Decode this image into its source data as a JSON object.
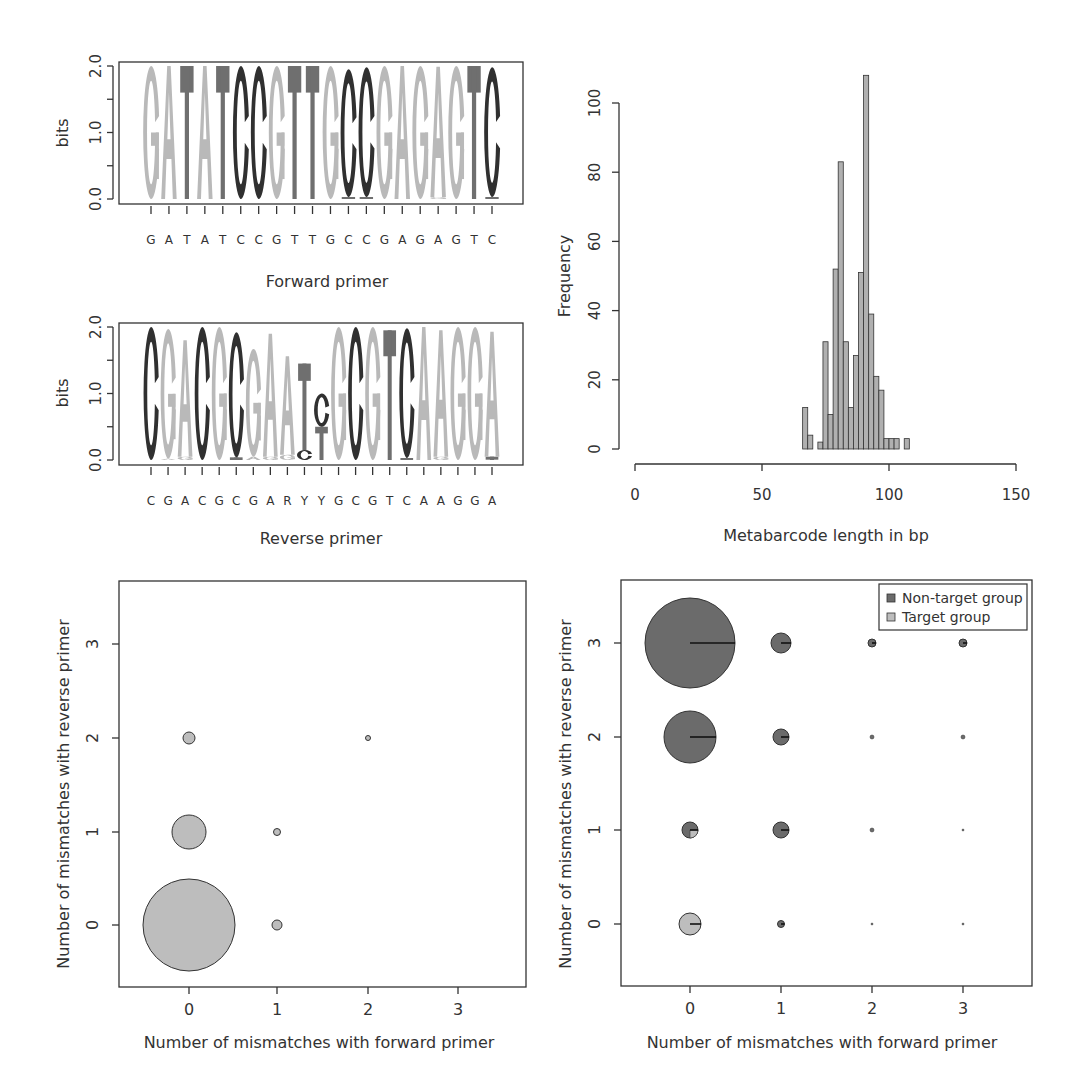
{
  "colors": {
    "A": "#b9b9b9",
    "G": "#b9b9b9",
    "T": "#6f6f6f",
    "C": "#303030",
    "hist_fill": "#b0b0b0",
    "non_target": "#6b6b6b",
    "target": "#bdbdbd",
    "axis": "#333333"
  },
  "chart_data": [
    {
      "id": "forward-logo",
      "type": "sequence_logo",
      "title": "",
      "xlabel": "Forward primer",
      "ylabel": "bits",
      "ylim": [
        0,
        2
      ],
      "yticks": [
        "0.0",
        "1.0",
        "2.0"
      ],
      "sequence": [
        "G",
        "A",
        "T",
        "A",
        "T",
        "C",
        "C",
        "G",
        "T",
        "T",
        "G",
        "C",
        "C",
        "G",
        "A",
        "G",
        "A",
        "G",
        "T",
        "C"
      ],
      "stacks": [
        [
          {
            "l": "G",
            "h": 2.0
          }
        ],
        [
          {
            "l": "A",
            "h": 2.0
          }
        ],
        [
          {
            "l": "T",
            "h": 2.0
          }
        ],
        [
          {
            "l": "A",
            "h": 2.0
          }
        ],
        [
          {
            "l": "T",
            "h": 2.0
          }
        ],
        [
          {
            "l": "C",
            "h": 2.0
          }
        ],
        [
          {
            "l": "C",
            "h": 2.0
          }
        ],
        [
          {
            "l": "G",
            "h": 2.0
          }
        ],
        [
          {
            "l": "T",
            "h": 2.0
          }
        ],
        [
          {
            "l": "T",
            "h": 2.0
          }
        ],
        [
          {
            "l": "G",
            "h": 2.0
          }
        ],
        [
          {
            "l": "T",
            "h": 0.03
          },
          {
            "l": "C",
            "h": 1.92
          }
        ],
        [
          {
            "l": "T",
            "h": 0.03
          },
          {
            "l": "C",
            "h": 1.95
          }
        ],
        [
          {
            "l": "G",
            "h": 2.0
          }
        ],
        [
          {
            "l": "A",
            "h": 2.0
          }
        ],
        [
          {
            "l": "G",
            "h": 2.0
          }
        ],
        [
          {
            "l": "G",
            "h": 0.03
          },
          {
            "l": "A",
            "h": 1.96
          }
        ],
        [
          {
            "l": "G",
            "h": 2.0
          }
        ],
        [
          {
            "l": "T",
            "h": 2.0
          }
        ],
        [
          {
            "l": "T",
            "h": 0.03
          },
          {
            "l": "C",
            "h": 1.95
          }
        ]
      ]
    },
    {
      "id": "reverse-logo",
      "type": "sequence_logo",
      "title": "",
      "xlabel": "Reverse primer",
      "ylabel": "bits",
      "ylim": [
        0,
        2
      ],
      "yticks": [
        "0.0",
        "1.0",
        "2.0"
      ],
      "sequence": [
        "C",
        "G",
        "A",
        "C",
        "G",
        "C",
        "G",
        "A",
        "R",
        "Y",
        "Y",
        "G",
        "C",
        "G",
        "T",
        "C",
        "A",
        "A",
        "G",
        "G",
        "A"
      ],
      "stacks": [
        [
          {
            "l": "C",
            "h": 2.0
          }
        ],
        [
          {
            "l": "A",
            "h": 0.02
          },
          {
            "l": "G",
            "h": 1.95
          }
        ],
        [
          {
            "l": "G",
            "h": 0.05
          },
          {
            "l": "A",
            "h": 1.75
          }
        ],
        [
          {
            "l": "C",
            "h": 2.0
          }
        ],
        [
          {
            "l": "G",
            "h": 2.0
          }
        ],
        [
          {
            "l": "T",
            "h": 0.04
          },
          {
            "l": "C",
            "h": 1.88
          }
        ],
        [
          {
            "l": "A",
            "h": 0.05
          },
          {
            "l": "G",
            "h": 1.62
          }
        ],
        [
          {
            "l": "G",
            "h": 0.05
          },
          {
            "l": "A",
            "h": 1.85
          }
        ],
        [
          {
            "l": "G",
            "h": 0.08
          },
          {
            "l": "A",
            "h": 1.48
          }
        ],
        [
          {
            "l": "C",
            "h": 0.15
          },
          {
            "l": "T",
            "h": 1.3
          }
        ],
        [
          {
            "l": "T",
            "h": 0.5
          },
          {
            "l": "C",
            "h": 0.5
          }
        ],
        [
          {
            "l": "G",
            "h": 2.0
          }
        ],
        [
          {
            "l": "C",
            "h": 2.0
          }
        ],
        [
          {
            "l": "G",
            "h": 2.0
          }
        ],
        [
          {
            "l": "T",
            "h": 1.95
          }
        ],
        [
          {
            "l": "T",
            "h": 0.03
          },
          {
            "l": "C",
            "h": 1.95
          }
        ],
        [
          {
            "l": "A",
            "h": 2.0
          }
        ],
        [
          {
            "l": "G",
            "h": 0.05
          },
          {
            "l": "A",
            "h": 1.9
          }
        ],
        [
          {
            "l": "G",
            "h": 2.0
          }
        ],
        [
          {
            "l": "G",
            "h": 2.0
          }
        ],
        [
          {
            "l": "T",
            "h": 0.05
          },
          {
            "l": "A",
            "h": 1.88
          }
        ]
      ]
    },
    {
      "id": "length-histogram",
      "type": "bar",
      "title": "",
      "xlabel": "Metabarcode length in bp",
      "ylabel": "Frequency",
      "xlim": [
        0,
        150
      ],
      "ylim": [
        0,
        100
      ],
      "xticks": [
        0,
        50,
        100,
        150
      ],
      "yticks": [
        0,
        20,
        40,
        60,
        80,
        100
      ],
      "bin_width": 2,
      "bin_start": 66,
      "values": [
        12,
        4,
        0,
        2,
        31,
        10,
        52,
        83,
        31,
        12,
        27,
        51,
        108,
        39,
        21,
        17,
        3,
        3,
        3,
        0,
        3
      ]
    },
    {
      "id": "target-bubble",
      "type": "scatter",
      "title": "",
      "xlabel": "Number of mismatches with forward primer",
      "ylabel": "Number of mismatches with reverse primer",
      "xlim": [
        -0.8,
        3.7
      ],
      "ylim": [
        -0.65,
        3.7
      ],
      "xticks": [
        0,
        1,
        2,
        3
      ],
      "yticks": [
        0,
        1,
        2,
        3
      ],
      "points": [
        {
          "x": 0,
          "y": 0,
          "r": 46,
          "target": 1.0
        },
        {
          "x": 0,
          "y": 1,
          "r": 17,
          "target": 1.0
        },
        {
          "x": 0,
          "y": 2,
          "r": 6,
          "target": 1.0
        },
        {
          "x": 1,
          "y": 0,
          "r": 5,
          "target": 1.0
        },
        {
          "x": 1,
          "y": 1,
          "r": 3.5,
          "target": 1.0
        },
        {
          "x": 2,
          "y": 2,
          "r": 2.5,
          "target": 1.0
        }
      ]
    },
    {
      "id": "group-pie-bubble",
      "type": "scatter",
      "title": "",
      "xlabel": "Number of mismatches with forward primer",
      "ylabel": "Number of mismatches with reverse primer",
      "xlim": [
        -0.75,
        3.75
      ],
      "ylim": [
        -0.65,
        3.7
      ],
      "xticks": [
        0,
        1,
        2,
        3
      ],
      "yticks": [
        0,
        1,
        2,
        3
      ],
      "legend": [
        {
          "label": "Non-target group",
          "key": "non_target"
        },
        {
          "label": "Target group",
          "key": "target"
        }
      ],
      "points": [
        {
          "x": 0,
          "y": 3,
          "r": 45,
          "target": 0.0
        },
        {
          "x": 1,
          "y": 3,
          "r": 10,
          "target": 0.0
        },
        {
          "x": 2,
          "y": 3,
          "r": 4,
          "target": 0.0
        },
        {
          "x": 3,
          "y": 3,
          "r": 4,
          "target": 0.0
        },
        {
          "x": 0,
          "y": 2,
          "r": 26,
          "target": 0.0
        },
        {
          "x": 1,
          "y": 2,
          "r": 8,
          "target": 0.0
        },
        {
          "x": 2,
          "y": 2,
          "r": 2,
          "target": 0.0
        },
        {
          "x": 3,
          "y": 2,
          "r": 2,
          "target": 0.0
        },
        {
          "x": 0,
          "y": 1,
          "r": 8,
          "target": 0.25
        },
        {
          "x": 1,
          "y": 1,
          "r": 8,
          "target": 0.0
        },
        {
          "x": 2,
          "y": 1,
          "r": 2,
          "target": 0.0
        },
        {
          "x": 3,
          "y": 1,
          "r": 1,
          "target": 0.0
        },
        {
          "x": 0,
          "y": 0,
          "r": 11,
          "target": 1.0
        },
        {
          "x": 1,
          "y": 0,
          "r": 3.5,
          "target": 0.0
        },
        {
          "x": 2,
          "y": 0,
          "r": 1,
          "target": 0.0
        },
        {
          "x": 3,
          "y": 0,
          "r": 1,
          "target": 0.0
        }
      ]
    }
  ],
  "labels": {
    "forward_xlabel": "Forward primer",
    "reverse_xlabel": "Reverse primer",
    "logo_ylabel": "bits",
    "hist_xlabel": "Metabarcode length in bp",
    "hist_ylabel": "Frequency",
    "bubble_xlabel": "Number of mismatches with forward primer",
    "bubble_ylabel": "Number of mismatches with reverse primer",
    "legend_non_target": "Non-target group",
    "legend_target": "Target group"
  }
}
